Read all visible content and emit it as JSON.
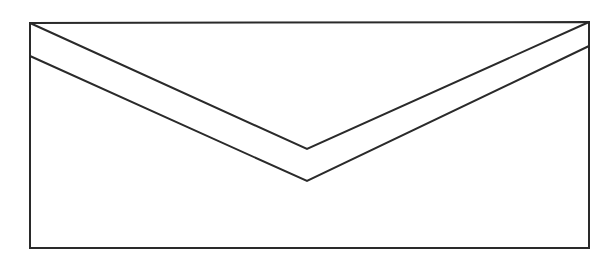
{
  "figure": {
    "stroke_color": "#2a2a2a",
    "background": "#ffffff",
    "stroke_width": 2,
    "rect": {
      "x1": 30,
      "y1": 23,
      "x2": 589,
      "y2": 248
    },
    "flap_outer": [
      [
        30,
        23
      ],
      [
        307,
        149
      ],
      [
        589,
        22
      ]
    ],
    "flap_inner": [
      [
        30,
        56
      ],
      [
        307,
        181
      ],
      [
        589,
        46
      ]
    ]
  }
}
